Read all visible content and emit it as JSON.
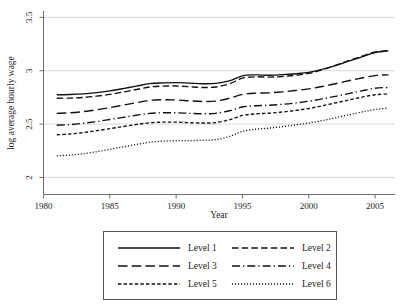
{
  "chart_data": {
    "type": "line",
    "title": "",
    "xlabel": "Year",
    "ylabel": "log average hourly wage",
    "xlim": [
      1980,
      2006.5
    ],
    "ylim": [
      1.84,
      3.56
    ],
    "xticks": [
      1980,
      1985,
      1990,
      1995,
      2000,
      2005
    ],
    "xticklabels": [
      "1980",
      "1985",
      "1990",
      "1995",
      "2000",
      "2005"
    ],
    "yticks": [
      2,
      2.5,
      3,
      3.5
    ],
    "yticklabels": [
      "2",
      "2.5",
      "3",
      "3.5"
    ],
    "grid": "horizontal",
    "legend_position": "below-center",
    "x": [
      1981,
      1982,
      1983,
      1984,
      1985,
      1986,
      1987,
      1988,
      1989,
      1990,
      1991,
      1992,
      1993,
      1994,
      1995,
      1996,
      1997,
      1998,
      1999,
      2000,
      2001,
      2002,
      2003,
      2004,
      2005,
      2006
    ],
    "series": [
      {
        "name": "Level 1",
        "style": "solid",
        "values": [
          2.775,
          2.777,
          2.783,
          2.795,
          2.812,
          2.833,
          2.856,
          2.879,
          2.886,
          2.889,
          2.884,
          2.878,
          2.881,
          2.905,
          2.952,
          2.961,
          2.958,
          2.963,
          2.972,
          2.985,
          3.012,
          3.048,
          3.09,
          3.13,
          3.17,
          3.188
        ]
      },
      {
        "name": "Level 2",
        "style": "dashed",
        "values": [
          2.742,
          2.744,
          2.75,
          2.762,
          2.778,
          2.8,
          2.824,
          2.848,
          2.856,
          2.857,
          2.85,
          2.843,
          2.848,
          2.876,
          2.93,
          2.943,
          2.94,
          2.946,
          2.958,
          2.975,
          3.008,
          3.05,
          3.094,
          3.136,
          3.176,
          3.186
        ]
      },
      {
        "name": "Level 3",
        "style": "longdash",
        "values": [
          2.601,
          2.606,
          2.617,
          2.634,
          2.654,
          2.677,
          2.7,
          2.722,
          2.728,
          2.726,
          2.718,
          2.712,
          2.716,
          2.742,
          2.778,
          2.79,
          2.793,
          2.802,
          2.815,
          2.83,
          2.852,
          2.878,
          2.906,
          2.932,
          2.955,
          2.962
        ]
      },
      {
        "name": "Level 4",
        "style": "dashdot",
        "values": [
          2.489,
          2.495,
          2.508,
          2.524,
          2.543,
          2.563,
          2.583,
          2.6,
          2.606,
          2.606,
          2.601,
          2.597,
          2.601,
          2.625,
          2.66,
          2.672,
          2.676,
          2.685,
          2.698,
          2.714,
          2.736,
          2.76,
          2.786,
          2.812,
          2.836,
          2.843
        ]
      },
      {
        "name": "Level 5",
        "style": "shortdash",
        "values": [
          2.4,
          2.407,
          2.42,
          2.438,
          2.457,
          2.477,
          2.496,
          2.512,
          2.518,
          2.518,
          2.513,
          2.51,
          2.514,
          2.54,
          2.581,
          2.596,
          2.602,
          2.613,
          2.628,
          2.646,
          2.671,
          2.698,
          2.726,
          2.752,
          2.775,
          2.782
        ]
      },
      {
        "name": "Level 6",
        "style": "dotted",
        "values": [
          2.203,
          2.209,
          2.222,
          2.241,
          2.263,
          2.286,
          2.309,
          2.33,
          2.34,
          2.344,
          2.345,
          2.348,
          2.355,
          2.383,
          2.432,
          2.452,
          2.462,
          2.476,
          2.492,
          2.51,
          2.533,
          2.559,
          2.587,
          2.613,
          2.637,
          2.648
        ]
      }
    ]
  },
  "legend": {
    "entries": [
      {
        "label": "Level 1"
      },
      {
        "label": "Level 2"
      },
      {
        "label": "Level 3"
      },
      {
        "label": "Level 4"
      },
      {
        "label": "Level 5"
      },
      {
        "label": "Level 6"
      }
    ]
  }
}
